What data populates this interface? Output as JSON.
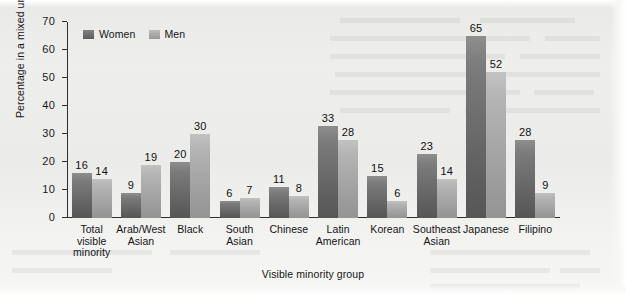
{
  "figure": {
    "background_color": "#ececeb",
    "women_color": "#6e6e6e",
    "men_color": "#a7a7a7"
  },
  "legend": {
    "position": "top-left-inside",
    "items": [
      {
        "label": "Women",
        "color": "#6e6e6e"
      },
      {
        "label": "Men",
        "color": "#a7a7a7"
      }
    ]
  },
  "axes": {
    "y_title": "Percentage in a mixed union",
    "x_title": "Visible minority group",
    "y_ticks": [
      "0",
      "10",
      "20",
      "30",
      "40",
      "50",
      "60",
      "70"
    ]
  },
  "chart_data": {
    "type": "bar",
    "title": "",
    "subtitle": "",
    "xlabel": "Visible minority group",
    "ylabel": "Percentage in a mixed union",
    "ylim": [
      0,
      70
    ],
    "ytick_step": 10,
    "grid": false,
    "legend_position": "top-left-inside",
    "categories": [
      "Total visible minority",
      "Arab/West Asian",
      "Black",
      "South Asian",
      "Chinese",
      "Latin American",
      "Korean",
      "Southeast Asian",
      "Japanese",
      "Filipino"
    ],
    "category_label_lines": [
      [
        "Total",
        "visible",
        "minority"
      ],
      [
        "Arab/West",
        "Asian"
      ],
      [
        "Black"
      ],
      [
        "South",
        "Asian"
      ],
      [
        "Chinese"
      ],
      [
        "Latin",
        "American"
      ],
      [
        "Korean"
      ],
      [
        "Southeast",
        "Asian"
      ],
      [
        "Japanese"
      ],
      [
        "Filipino"
      ]
    ],
    "series": [
      {
        "name": "Women",
        "color": "#6e6e6e",
        "values": [
          16,
          9,
          20,
          6,
          11,
          33,
          15,
          23,
          65,
          28
        ]
      },
      {
        "name": "Men",
        "color": "#a7a7a7",
        "values": [
          14,
          19,
          30,
          7,
          8,
          28,
          6,
          14,
          52,
          9
        ]
      }
    ]
  }
}
